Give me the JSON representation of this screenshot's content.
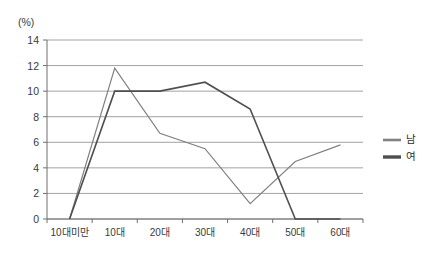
{
  "chart_data": {
    "type": "line",
    "title": "",
    "xlabel": "",
    "ylabel": "(%)",
    "unit_label": "(%)",
    "categories": [
      "10대미만",
      "10대",
      "20대",
      "30대",
      "40대",
      "50대",
      "60대"
    ],
    "ylim": [
      0,
      14
    ],
    "yticks": [
      0,
      2,
      4,
      6,
      8,
      10,
      12,
      14
    ],
    "ytick_labels": [
      "0",
      "2",
      "4",
      "6",
      "8",
      "10",
      "12",
      "14"
    ],
    "grid": true,
    "grid_axis": "y",
    "legend_position": "right",
    "series": [
      {
        "name": "남",
        "color": "#808080",
        "width": 1.2,
        "values": [
          0.0,
          11.8,
          6.7,
          5.5,
          1.2,
          4.5,
          5.8
        ]
      },
      {
        "name": "여",
        "color": "#4f4f4f",
        "width": 1.6,
        "values": [
          0.0,
          10.0,
          10.0,
          10.7,
          8.6,
          0.0,
          0.0
        ]
      }
    ]
  },
  "legend": {
    "items": [
      {
        "label": "남",
        "color": "#808080",
        "width": 2.6
      },
      {
        "label": "여",
        "color": "#4f4f4f",
        "width": 3.4
      }
    ]
  },
  "axes": {
    "y_unit": "(%)",
    "grid_color": "#8a8a8a",
    "axis_color": "#6e6e6e",
    "tick_color": "#6e6e6e",
    "text_color": "#3a3a3a"
  },
  "plot_geometry": {
    "left": 47,
    "right": 363,
    "top": 40,
    "bottom": 219
  }
}
